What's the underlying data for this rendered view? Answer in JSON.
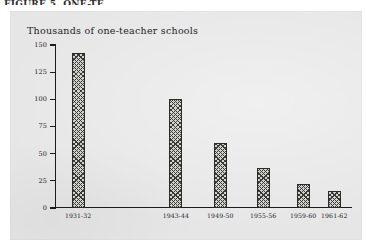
{
  "scan": {
    "top_caption_fragment": "FIGURE 5. ONE-TE"
  },
  "chart_data": {
    "type": "bar",
    "title": "",
    "axis_note": "Thousands of one-teacher schools",
    "xlabel": "",
    "ylabel": "Thousands of one-teacher schools",
    "categories": [
      "1931-32",
      "1943-44",
      "1949-50",
      "1955-56",
      "1959-60",
      "1961-62"
    ],
    "values": [
      143,
      100,
      60,
      37,
      22,
      16
    ],
    "ylim": [
      0,
      150
    ],
    "yticks": [
      0,
      25,
      50,
      75,
      100,
      125,
      150
    ],
    "ytick_labels": [
      "0",
      "25",
      "50",
      "75",
      "100",
      "125",
      "150"
    ],
    "grid": false,
    "legend": "none",
    "bar_fill": "diagonal-cross-hatch",
    "bar_positions_pct": [
      7.5,
      40.5,
      55.5,
      70.0,
      83.5,
      94.0
    ],
    "bar_width_px": 13
  },
  "colors": {
    "panel_background": "#e6e6e6",
    "page_background": "#ffffff",
    "axis": "#1c1c1a",
    "text": "#20201e",
    "bar_hatch": "#3a3a36",
    "bar_base": "#d2d2cf"
  }
}
